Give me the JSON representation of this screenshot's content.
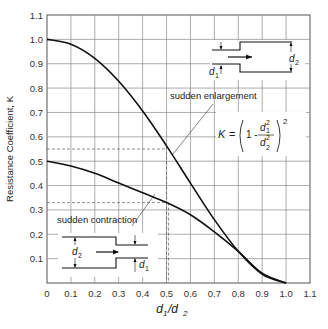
{
  "chart_data": {
    "type": "line",
    "title": "",
    "xlabel": "d1/d2",
    "ylabel": "Resistance Coefficient, K",
    "xlim": [
      0,
      1.1
    ],
    "ylim": [
      0,
      1.1
    ],
    "x_ticks": [
      "0",
      "0.1",
      "0.2",
      "0.3",
      "0.4",
      "0.5",
      "0.6",
      "0.7",
      "0.8",
      "0.9",
      "1.0",
      "1.1"
    ],
    "y_ticks": [
      "0.1",
      "0.2",
      "0.3",
      "0.4",
      "0.5",
      "0.6",
      "0.7",
      "0.8",
      "0.9",
      "1.0",
      "1.1"
    ],
    "grid": true,
    "x": [
      0,
      0.1,
      0.2,
      0.3,
      0.4,
      0.5,
      0.6,
      0.7,
      0.8,
      0.9,
      1.0
    ],
    "series": [
      {
        "name": "sudden enlargement",
        "values": [
          1.0,
          0.98,
          0.922,
          0.828,
          0.706,
          0.563,
          0.41,
          0.26,
          0.13,
          0.036,
          0.0
        ]
      },
      {
        "name": "sudden contraction",
        "values": [
          0.5,
          0.48,
          0.45,
          0.41,
          0.37,
          0.33,
          0.28,
          0.21,
          0.13,
          0.04,
          0.0
        ]
      }
    ],
    "annotations": [
      {
        "text": "sudden enlargement",
        "points_to": [
          0.5,
          0.56
        ]
      },
      {
        "text": "sudden contraction",
        "points_to": [
          0.5,
          0.33
        ]
      },
      {
        "text": "K = (1 - d1²/d2²)²",
        "type": "formula"
      },
      {
        "type": "reference-lines",
        "horizontal": [
          0.55,
          0.33
        ],
        "vertical": [
          0.5
        ]
      }
    ]
  },
  "labels": {
    "xlabel_d1": "d",
    "xlabel_sub1": "1",
    "xlabel_slash": "/d",
    "xlabel_sub2": "2",
    "ylabel": "Resistance  Coefficient, K",
    "enlargement": "sudden enlargement",
    "contraction": "sudden contraction",
    "formula_k": "K",
    "formula_eq": "=",
    "formula_one": "1 -",
    "d": "d",
    "sub1": "1",
    "sub2": "2",
    "sup2": "2"
  }
}
